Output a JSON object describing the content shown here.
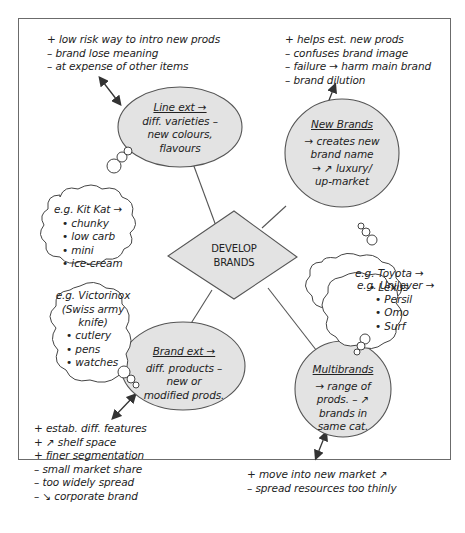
{
  "center": {
    "line1": "DEVELOP",
    "line2": "BRANDS"
  },
  "line_ext": {
    "title": "Line ext →",
    "body": [
      "diff. varieties –",
      "new colours,",
      "flavours"
    ],
    "notes": [
      "+ low risk way to intro new prods",
      "– brand lose meaning",
      "– at expense of other items"
    ],
    "example": [
      "e.g. Kit Kat →",
      "• chunky",
      "• low carb",
      "• mini",
      "• ice-cream"
    ]
  },
  "new_brands": {
    "title": "New Brands",
    "body": [
      "→ creates new",
      "brand name",
      "→ ↗ luxury/",
      "up-market"
    ],
    "notes": [
      "+ helps est. new prods",
      "– confuses brand image",
      "– failure → harm main brand",
      "– brand dilution"
    ],
    "example": [
      "e.g. Toyota →",
      "• Lexus"
    ]
  },
  "brand_ext": {
    "title": "Brand ext →",
    "body": [
      "diff. products –",
      "new or",
      "modified prods."
    ],
    "notes": [
      "+ estab. diff. features",
      "+ ↗ shelf space",
      "+ finer segmentation",
      "– small market share",
      "– too widely spread",
      "– ↘ corporate brand"
    ],
    "example": [
      "e.g. Victorinox",
      "(Swiss army",
      "knife)",
      "• cutlery",
      "• pens",
      "• watches"
    ]
  },
  "multibrands": {
    "title": "Multibrands",
    "body": [
      "→ range of",
      "prods. – ↗",
      "brands in",
      "same cat."
    ],
    "notes": [
      "+ move into new market ↗",
      "– spread resources too thinly"
    ],
    "example": [
      "e.g. Unilever →",
      "• Persil",
      "• Omo",
      "• Surf"
    ]
  },
  "colors": {
    "node_fill": "#e3e3e3",
    "stroke": "#555555",
    "frame": "#6b6b6b"
  }
}
